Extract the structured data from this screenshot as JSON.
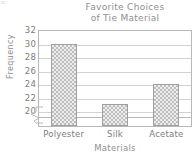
{
  "chart_data": {
    "type": "bar",
    "title": "Favorite Choices of Tie Material",
    "title_lines": [
      "Favorite Choices",
      "of Tie Material"
    ],
    "categories": [
      "Polyester",
      "Silk",
      "Acetate"
    ],
    "values": [
      30,
      21,
      24
    ],
    "xlabel": "Materials",
    "ylabel": "Frequency",
    "ylim": [
      19,
      32
    ],
    "yticks": [
      32,
      30,
      28,
      26,
      24,
      22,
      20
    ],
    "axis_break": true,
    "grid": true,
    "legend": null,
    "bar_fill": "#bdbdbd",
    "bar_pattern": "checkerboard",
    "axis_color": "#b8b8b8",
    "text_color": "#8a8a8a"
  },
  "corner_artifact": "≡"
}
